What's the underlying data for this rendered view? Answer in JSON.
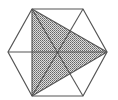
{
  "diagram": {
    "stroke_color": "#555555",
    "shade_color": "#777777",
    "vertices": {
      "A": [
        32,
        9
      ],
      "B": [
        83,
        9
      ],
      "C": [
        107,
        52
      ],
      "D": [
        83,
        96
      ],
      "E": [
        32,
        96
      ],
      "F": [
        8,
        52
      ]
    },
    "center": [
      57,
      52
    ],
    "shaded_triangle": [
      "A",
      "E",
      "C"
    ],
    "lines": [
      [
        "F",
        "C"
      ],
      [
        "A",
        "D"
      ],
      [
        "B",
        "E"
      ],
      [
        "A",
        "E"
      ],
      [
        "A",
        "C"
      ],
      [
        "E",
        "C"
      ]
    ]
  }
}
